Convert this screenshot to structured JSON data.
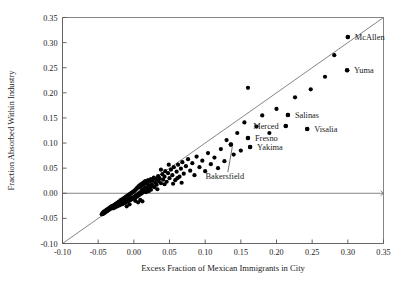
{
  "chart_data": {
    "type": "scatter",
    "title": "",
    "xlabel": "Excess Fraction of Mexican Immigrants in City",
    "ylabel": "Fraction Absorbed Within Industry",
    "xlim": [
      -0.1,
      0.35
    ],
    "ylim": [
      -0.1,
      0.35
    ],
    "xticks": [
      "-0.10",
      "-0.05",
      "0.00",
      "0.05",
      "0.10",
      "0.15",
      "0.20",
      "0.25",
      "0.30",
      "0.35"
    ],
    "xtick_values": [
      -0.1,
      -0.05,
      0.0,
      0.05,
      0.1,
      0.15,
      0.2,
      0.25,
      0.3,
      0.35
    ],
    "yticks": [
      "-0.10",
      "-0.05",
      "0.00",
      "0.05",
      "0.10",
      "0.15",
      "0.20",
      "0.25",
      "0.30",
      "0.35"
    ],
    "ytick_values": [
      -0.1,
      -0.05,
      0.0,
      0.05,
      0.1,
      0.15,
      0.2,
      0.25,
      0.3,
      0.35
    ],
    "grid": false,
    "legend": "none",
    "reference_line": {
      "name": "45-degree line",
      "from": [
        -0.1,
        -0.1
      ],
      "to": [
        0.35,
        0.35
      ]
    },
    "zero_line": {
      "name": "y-zero horizontal",
      "y": 0.0
    },
    "marker": {
      "shape": "circle",
      "color": "#000000",
      "size": 2.1
    },
    "annotations": [
      {
        "label": "McAllen",
        "x": 0.3,
        "y": 0.311,
        "label_dx": 7,
        "label_dy": 2.6,
        "leader": false
      },
      {
        "label": "Yuma",
        "x": 0.299,
        "y": 0.245,
        "label_dx": 7,
        "label_dy": 2.6,
        "leader": false
      },
      {
        "label": "Salinas",
        "x": 0.216,
        "y": 0.156,
        "label_dx": 7,
        "label_dy": 2.6,
        "leader": false
      },
      {
        "label": "Merced",
        "x": 0.213,
        "y": 0.134,
        "label_dx": -7,
        "label_dy": 2.6,
        "anchor": "end",
        "leader": false
      },
      {
        "label": "Visalia",
        "x": 0.243,
        "y": 0.128,
        "label_dx": 7,
        "label_dy": 2.6,
        "leader": false
      },
      {
        "label": "Fresno",
        "x": 0.16,
        "y": 0.11,
        "label_dx": 7,
        "label_dy": 2.6,
        "leader": false
      },
      {
        "label": "Yakima",
        "x": 0.163,
        "y": 0.092,
        "label_dx": 7,
        "label_dy": 2.6,
        "leader": false
      },
      {
        "label": "Bakersfield",
        "x": 0.136,
        "y": 0.097,
        "label_dx": -6,
        "label_dy": 34,
        "anchor": "middle",
        "leader": true
      }
    ],
    "points": [
      [
        -0.045,
        -0.042
      ],
      [
        -0.044,
        -0.04
      ],
      [
        -0.043,
        -0.041
      ],
      [
        -0.043,
        -0.038
      ],
      [
        -0.042,
        -0.04
      ],
      [
        -0.042,
        -0.037
      ],
      [
        -0.041,
        -0.039
      ],
      [
        -0.041,
        -0.036
      ],
      [
        -0.04,
        -0.038
      ],
      [
        -0.04,
        -0.035
      ],
      [
        -0.039,
        -0.037
      ],
      [
        -0.039,
        -0.034
      ],
      [
        -0.038,
        -0.036
      ],
      [
        -0.038,
        -0.033
      ],
      [
        -0.037,
        -0.035
      ],
      [
        -0.037,
        -0.032
      ],
      [
        -0.036,
        -0.034
      ],
      [
        -0.036,
        -0.031
      ],
      [
        -0.035,
        -0.033
      ],
      [
        -0.035,
        -0.03
      ],
      [
        -0.034,
        -0.032
      ],
      [
        -0.034,
        -0.029
      ],
      [
        -0.033,
        -0.031
      ],
      [
        -0.033,
        -0.028
      ],
      [
        -0.032,
        -0.03
      ],
      [
        -0.032,
        -0.027
      ],
      [
        -0.031,
        -0.029
      ],
      [
        -0.031,
        -0.026
      ],
      [
        -0.03,
        -0.028
      ],
      [
        -0.03,
        -0.025
      ],
      [
        -0.029,
        -0.03
      ],
      [
        -0.029,
        -0.027
      ],
      [
        -0.028,
        -0.029
      ],
      [
        -0.028,
        -0.024
      ],
      [
        -0.027,
        -0.026
      ],
      [
        -0.027,
        -0.023
      ],
      [
        -0.026,
        -0.028
      ],
      [
        -0.026,
        -0.022
      ],
      [
        -0.025,
        -0.025
      ],
      [
        -0.025,
        -0.021
      ],
      [
        -0.024,
        -0.024
      ],
      [
        -0.024,
        -0.02
      ],
      [
        -0.023,
        -0.026
      ],
      [
        -0.023,
        -0.019
      ],
      [
        -0.022,
        -0.023
      ],
      [
        -0.022,
        -0.018
      ],
      [
        -0.021,
        -0.022
      ],
      [
        -0.021,
        -0.017
      ],
      [
        -0.02,
        -0.024
      ],
      [
        -0.02,
        -0.016
      ],
      [
        -0.019,
        -0.021
      ],
      [
        -0.019,
        -0.015
      ],
      [
        -0.018,
        -0.02
      ],
      [
        -0.018,
        -0.013
      ],
      [
        -0.017,
        -0.022
      ],
      [
        -0.017,
        -0.014
      ],
      [
        -0.016,
        -0.019
      ],
      [
        -0.016,
        -0.012
      ],
      [
        -0.015,
        -0.021
      ],
      [
        -0.015,
        -0.011
      ],
      [
        -0.014,
        -0.018
      ],
      [
        -0.014,
        -0.01
      ],
      [
        -0.013,
        -0.016
      ],
      [
        -0.013,
        -0.009
      ],
      [
        -0.012,
        -0.019
      ],
      [
        -0.012,
        -0.008
      ],
      [
        -0.011,
        -0.015
      ],
      [
        -0.011,
        -0.007
      ],
      [
        -0.01,
        -0.017
      ],
      [
        -0.01,
        -0.006
      ],
      [
        -0.009,
        -0.013
      ],
      [
        -0.009,
        -0.005
      ],
      [
        -0.008,
        -0.016
      ],
      [
        -0.008,
        -0.004
      ],
      [
        -0.007,
        -0.012
      ],
      [
        -0.007,
        -0.003
      ],
      [
        -0.006,
        -0.014
      ],
      [
        -0.006,
        -0.002
      ],
      [
        -0.005,
        -0.01
      ],
      [
        -0.005,
        -0.001
      ],
      [
        -0.004,
        -0.013
      ],
      [
        -0.004,
        0.0
      ],
      [
        -0.003,
        -0.009
      ],
      [
        -0.003,
        0.001
      ],
      [
        -0.002,
        -0.011
      ],
      [
        -0.002,
        0.002
      ],
      [
        -0.001,
        -0.008
      ],
      [
        -0.001,
        0.003
      ],
      [
        0.0,
        -0.01
      ],
      [
        0.0,
        0.004
      ],
      [
        0.001,
        -0.006
      ],
      [
        0.001,
        0.005
      ],
      [
        0.002,
        -0.009
      ],
      [
        0.002,
        0.007
      ],
      [
        0.003,
        -0.004
      ],
      [
        0.003,
        0.008
      ],
      [
        0.004,
        -0.007
      ],
      [
        0.004,
        0.01
      ],
      [
        0.005,
        -0.002
      ],
      [
        0.005,
        0.011
      ],
      [
        0.006,
        -0.005
      ],
      [
        0.006,
        0.013
      ],
      [
        0.007,
        0.0
      ],
      [
        0.007,
        0.014
      ],
      [
        0.008,
        -0.003
      ],
      [
        0.008,
        0.016
      ],
      [
        0.009,
        0.002
      ],
      [
        0.009,
        0.012
      ],
      [
        0.01,
        -0.001
      ],
      [
        0.01,
        0.018
      ],
      [
        0.011,
        0.005
      ],
      [
        0.011,
        0.015
      ],
      [
        0.012,
        0.001
      ],
      [
        0.012,
        0.02
      ],
      [
        0.013,
        0.007
      ],
      [
        0.013,
        0.017
      ],
      [
        0.014,
        0.003
      ],
      [
        0.014,
        0.022
      ],
      [
        0.015,
        0.009
      ],
      [
        0.015,
        0.019
      ],
      [
        0.016,
        0.005
      ],
      [
        0.016,
        0.024
      ],
      [
        0.017,
        0.012
      ],
      [
        0.018,
        0.021
      ],
      [
        0.019,
        0.008
      ],
      [
        0.02,
        0.026
      ],
      [
        0.021,
        0.015
      ],
      [
        0.022,
        0.023
      ],
      [
        0.023,
        0.011
      ],
      [
        0.024,
        0.028
      ],
      [
        0.025,
        0.018
      ],
      [
        0.026,
        0.025
      ],
      [
        0.027,
        0.014
      ],
      [
        0.028,
        0.031
      ],
      [
        0.03,
        0.021
      ],
      [
        0.031,
        0.028
      ],
      [
        0.032,
        0.017
      ],
      [
        0.034,
        0.034
      ],
      [
        0.035,
        0.024
      ],
      [
        0.036,
        0.03
      ],
      [
        0.038,
        0.02
      ],
      [
        0.04,
        0.038
      ],
      [
        0.041,
        0.027
      ],
      [
        0.043,
        0.033
      ],
      [
        0.044,
        0.044
      ],
      [
        0.046,
        0.023
      ],
      [
        0.048,
        0.04
      ],
      [
        0.05,
        0.03
      ],
      [
        0.052,
        0.047
      ],
      [
        0.054,
        0.036
      ],
      [
        0.056,
        0.052
      ],
      [
        0.058,
        0.026
      ],
      [
        0.06,
        0.043
      ],
      [
        0.062,
        0.057
      ],
      [
        0.064,
        0.033
      ],
      [
        0.066,
        0.049
      ],
      [
        0.068,
        0.062
      ],
      [
        0.07,
        0.039
      ],
      [
        0.073,
        0.054
      ],
      [
        0.076,
        0.068
      ],
      [
        0.079,
        0.045
      ],
      [
        0.082,
        0.06
      ],
      [
        0.085,
        0.036
      ],
      [
        0.088,
        0.073
      ],
      [
        0.092,
        0.052
      ],
      [
        0.096,
        0.065
      ],
      [
        0.1,
        0.044
      ],
      [
        0.104,
        0.08
      ],
      [
        0.108,
        0.058
      ],
      [
        0.113,
        0.071
      ],
      [
        0.118,
        0.05
      ],
      [
        0.122,
        0.088
      ],
      [
        0.127,
        0.064
      ],
      [
        0.13,
        0.106
      ],
      [
        0.136,
        0.097
      ],
      [
        0.14,
        0.077
      ],
      [
        0.145,
        0.12
      ],
      [
        0.15,
        0.085
      ],
      [
        0.155,
        0.141
      ],
      [
        0.16,
        0.11
      ],
      [
        0.163,
        0.092
      ],
      [
        0.16,
        0.21
      ],
      [
        0.172,
        0.133
      ],
      [
        0.18,
        0.155
      ],
      [
        0.19,
        0.12
      ],
      [
        0.2,
        0.168
      ],
      [
        0.213,
        0.134
      ],
      [
        0.216,
        0.156
      ],
      [
        0.226,
        0.191
      ],
      [
        0.243,
        0.128
      ],
      [
        0.248,
        0.207
      ],
      [
        0.268,
        0.232
      ],
      [
        0.281,
        0.275
      ],
      [
        0.299,
        0.245
      ],
      [
        0.3,
        0.311
      ],
      [
        0.021,
        0.004
      ],
      [
        0.019,
        0.019
      ],
      [
        0.024,
        0.007
      ],
      [
        0.017,
        0.002
      ],
      [
        0.029,
        0.012
      ],
      [
        0.033,
        0.008
      ],
      [
        0.038,
        0.047
      ],
      [
        0.043,
        0.018
      ],
      [
        0.049,
        0.057
      ],
      [
        0.055,
        0.019
      ],
      [
        0.061,
        0.03
      ],
      [
        0.067,
        0.021
      ],
      [
        0.012,
        -0.016
      ],
      [
        0.009,
        -0.013
      ],
      [
        0.006,
        -0.018
      ],
      [
        0.002,
        -0.015
      ],
      [
        -0.006,
        -0.022
      ],
      [
        -0.01,
        -0.026
      ]
    ]
  }
}
